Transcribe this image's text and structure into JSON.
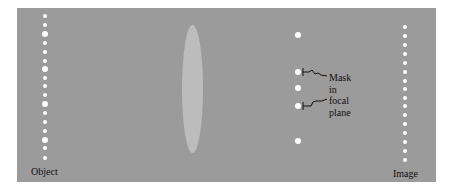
{
  "diagram": {
    "type": "optics-spatial-filtering",
    "background_color": "#9b9b9b",
    "dot_color": "#ffffff",
    "lens_color": "#bcbcbc",
    "labels": {
      "object": "Object",
      "image": "Image",
      "mask_line1": "Mask",
      "mask_line2": "in",
      "mask_line3": "focal",
      "mask_line4": "plane"
    },
    "object_dots": {
      "x": 45,
      "y": [
        16,
        25,
        34,
        43,
        52,
        61,
        69,
        78,
        86,
        95,
        104,
        113,
        122,
        131,
        140,
        148,
        158
      ],
      "large_indices": [
        2,
        6,
        10,
        14
      ]
    },
    "image_dots": {
      "x": 405,
      "y": [
        27,
        36,
        45,
        54,
        63,
        72,
        81,
        89,
        98,
        106,
        115,
        124,
        133,
        142,
        151,
        160
      ]
    },
    "focal_plane_dots": {
      "x": 298,
      "y": [
        35,
        72,
        88,
        106,
        141
      ],
      "masked_indices": [
        1,
        3
      ]
    },
    "lens": {
      "x": 192,
      "top": 25,
      "bottom": 152
    }
  }
}
